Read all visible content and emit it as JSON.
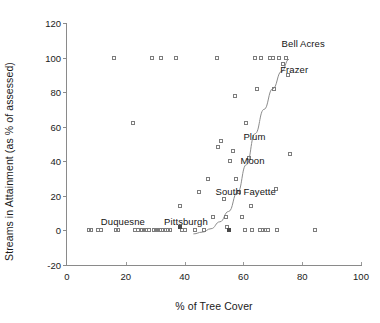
{
  "chart_data": {
    "type": "scatter",
    "title": "",
    "xlabel": "% of Tree Cover",
    "ylabel": "Streams in Attainment (as % of assessed)",
    "xlim": [
      0,
      100
    ],
    "ylim": [
      -20,
      120
    ],
    "xticks": [
      0,
      20,
      40,
      60,
      80,
      100
    ],
    "yticks": [
      -20,
      0,
      20,
      40,
      60,
      80,
      100,
      120
    ],
    "grid": false,
    "legend": "none",
    "marker_style": "open square, gray outline",
    "series": [
      {
        "name": "Municipalities",
        "points": [
          [
            7.5,
            0
          ],
          [
            8.3,
            0
          ],
          [
            10.5,
            0
          ],
          [
            11.4,
            0
          ],
          [
            16.0,
            100
          ],
          [
            16.5,
            0
          ],
          [
            17.2,
            0
          ],
          [
            22.5,
            62
          ],
          [
            23.0,
            0
          ],
          [
            24.0,
            0
          ],
          [
            25.5,
            0
          ],
          [
            26.3,
            0
          ],
          [
            27.0,
            0
          ],
          [
            28.0,
            0
          ],
          [
            29.0,
            100
          ],
          [
            32.0,
            100
          ],
          [
            29.5,
            0
          ],
          [
            30.2,
            0
          ],
          [
            31.0,
            0
          ],
          [
            31.8,
            0
          ],
          [
            32.6,
            0
          ],
          [
            33.4,
            0
          ],
          [
            34.2,
            0
          ],
          [
            35.0,
            0
          ],
          [
            37.0,
            100
          ],
          [
            38.5,
            14
          ],
          [
            38.5,
            2
          ],
          [
            39.2,
            0
          ],
          [
            40.0,
            0
          ],
          [
            43.5,
            0
          ],
          [
            44.8,
            22
          ],
          [
            46.5,
            0
          ],
          [
            48.0,
            30
          ],
          [
            49.5,
            8
          ],
          [
            51.0,
            100
          ],
          [
            51.5,
            48
          ],
          [
            52.5,
            52
          ],
          [
            53.5,
            18
          ],
          [
            54.0,
            8
          ],
          [
            54.5,
            2
          ],
          [
            55.0,
            0
          ],
          [
            55.5,
            40
          ],
          [
            56.5,
            46
          ],
          [
            57.0,
            78
          ],
          [
            57.5,
            30
          ],
          [
            58.5,
            22
          ],
          [
            59.5,
            8
          ],
          [
            60.5,
            0
          ],
          [
            61.0,
            62
          ],
          [
            62.0,
            42
          ],
          [
            62.5,
            14
          ],
          [
            63.0,
            0
          ],
          [
            64.0,
            100
          ],
          [
            66.0,
            100
          ],
          [
            64.5,
            82
          ],
          [
            65.5,
            0
          ],
          [
            66.5,
            0
          ],
          [
            67.5,
            0
          ],
          [
            68.5,
            0
          ],
          [
            69.0,
            100
          ],
          [
            70.0,
            100
          ],
          [
            70.5,
            82
          ],
          [
            71.0,
            24
          ],
          [
            71.5,
            0
          ],
          [
            72.0,
            100
          ],
          [
            73.5,
            96
          ],
          [
            74.5,
            100
          ],
          [
            75.0,
            90
          ],
          [
            76.0,
            44
          ],
          [
            84.5,
            0
          ]
        ]
      }
    ],
    "fit_curve": {
      "label": "fitted exponential trend",
      "points": [
        [
          43.0,
          -2
        ],
        [
          46.0,
          -1
        ],
        [
          49.0,
          1
        ],
        [
          52.0,
          5
        ],
        [
          55.0,
          11
        ],
        [
          58.0,
          22
        ],
        [
          61.0,
          38
        ],
        [
          64.0,
          56
        ],
        [
          67.0,
          70
        ],
        [
          70.0,
          82
        ],
        [
          73.0,
          92
        ],
        [
          75.5,
          99
        ]
      ]
    },
    "annotations": [
      {
        "text": "Bell Acres",
        "x": 73.0,
        "y": 108
      },
      {
        "text": "Frazer",
        "x": 72.5,
        "y": 93
      },
      {
        "text": "Plum",
        "x": 60.0,
        "y": 54
      },
      {
        "text": "Moon",
        "x": 59.0,
        "y": 40
      },
      {
        "text": "South Fayette",
        "x": 50.5,
        "y": 22
      },
      {
        "text": "Duquesne",
        "x": 11.5,
        "y": 5
      },
      {
        "text": "Pittsburgh",
        "x": 33.0,
        "y": 5
      }
    ]
  },
  "colors": {
    "axis": "#8a8a8a",
    "marker_outline": "#7d7d7d",
    "curve": "#8c8c8c",
    "text": "#1a1a1a"
  }
}
